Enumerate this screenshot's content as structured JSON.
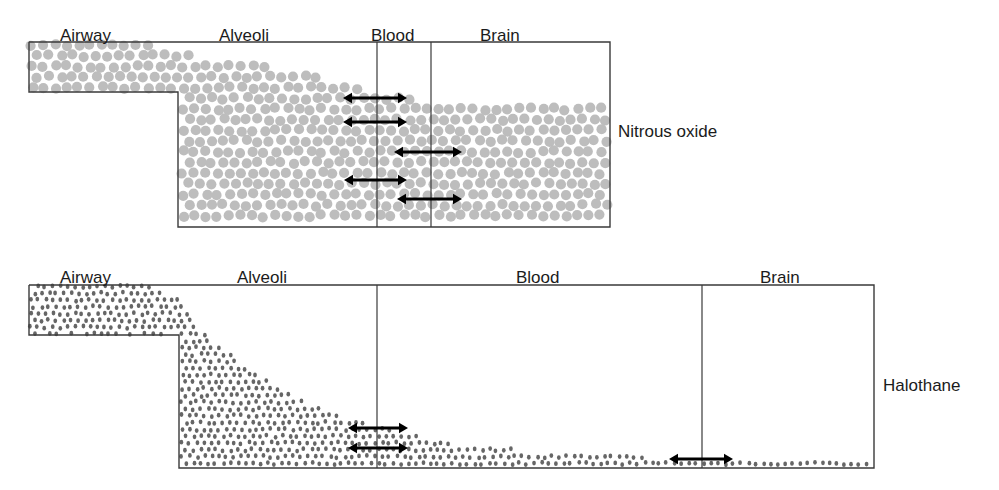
{
  "figure": {
    "type": "diagram",
    "background_color": "#ffffff",
    "line_color": "#3a3a3a",
    "text_color": "#1b1b1b"
  },
  "panels": [
    {
      "id": "nitrous-oxide",
      "agent_label": "Nitrous oxide",
      "agent_label_pos": {
        "x": 618,
        "y": 122
      },
      "dot": {
        "color": "#bdbdbd",
        "radius": 5.1,
        "spacing": 11.6,
        "jitter": 1.5,
        "shape": "circle"
      },
      "frame": {
        "left": 29,
        "top": 42,
        "right": 610,
        "bottom": 227,
        "step_x": 178,
        "step_y": 92
      },
      "dividers": [
        {
          "name": "alveoli-blood-divider",
          "x": 377
        },
        {
          "name": "blood-brain-divider",
          "x": 431
        }
      ],
      "columns": [
        {
          "label": "Airway",
          "x": 60,
          "y": 26
        },
        {
          "label": "Alveoli",
          "x": 219,
          "y": 26
        },
        {
          "label": "Blood",
          "x": 371,
          "y": 26
        },
        {
          "label": "Brain",
          "x": 480,
          "y": 26
        }
      ],
      "profile_note": "Gas fills airway to the top border; alveoli nearly full; blood and brain partially filled, concentration drops only slightly across compartments (low blood solubility).",
      "profile_points": [
        {
          "x": 29,
          "y": 42
        },
        {
          "x": 150,
          "y": 44
        },
        {
          "x": 200,
          "y": 56
        },
        {
          "x": 300,
          "y": 70
        },
        {
          "x": 360,
          "y": 86
        },
        {
          "x": 380,
          "y": 94
        },
        {
          "x": 420,
          "y": 100
        },
        {
          "x": 470,
          "y": 102
        },
        {
          "x": 540,
          "y": 103
        },
        {
          "x": 610,
          "y": 104
        }
      ],
      "arrows": [
        {
          "name": "gradient-arrow-1",
          "x1": 343,
          "x2": 407,
          "y": 98
        },
        {
          "name": "gradient-arrow-2",
          "x1": 343,
          "x2": 407,
          "y": 122
        },
        {
          "name": "gradient-arrow-3",
          "x1": 394,
          "x2": 462,
          "y": 152
        },
        {
          "name": "gradient-arrow-4",
          "x1": 344,
          "x2": 407,
          "y": 180
        },
        {
          "name": "gradient-arrow-5",
          "x1": 397,
          "x2": 462,
          "y": 199
        }
      ]
    },
    {
      "id": "halothane",
      "agent_label": "Halothane",
      "agent_label_pos": {
        "x": 883,
        "y": 376
      },
      "dot": {
        "color": "#666666",
        "radius": 2.4,
        "spacing": 7.4,
        "jitter": 1.3,
        "shape": "ellipse"
      },
      "frame": {
        "left": 29,
        "top": 285,
        "right": 874,
        "bottom": 468,
        "step_x": 179,
        "step_y": 335
      },
      "dividers": [
        {
          "name": "alveoli-blood-divider",
          "x": 377
        },
        {
          "name": "blood-brain-divider",
          "x": 702
        }
      ],
      "columns": [
        {
          "label": "Airway",
          "x": 60,
          "y": 268
        },
        {
          "label": "Alveoli",
          "x": 237,
          "y": 268
        },
        {
          "label": "Blood",
          "x": 516,
          "y": 268
        },
        {
          "label": "Brain",
          "x": 760,
          "y": 268
        }
      ],
      "profile_note": "Vapour fills airway to the top border, then concentration falls steeply through alveoli and blood, leaving only a thin layer reaching the brain (high blood solubility).",
      "profile_points": [
        {
          "x": 29,
          "y": 285
        },
        {
          "x": 150,
          "y": 286
        },
        {
          "x": 179,
          "y": 300
        },
        {
          "x": 200,
          "y": 330
        },
        {
          "x": 250,
          "y": 370
        },
        {
          "x": 300,
          "y": 400
        },
        {
          "x": 350,
          "y": 418
        },
        {
          "x": 400,
          "y": 432
        },
        {
          "x": 460,
          "y": 444
        },
        {
          "x": 540,
          "y": 452
        },
        {
          "x": 620,
          "y": 456
        },
        {
          "x": 702,
          "y": 458
        },
        {
          "x": 790,
          "y": 459
        },
        {
          "x": 874,
          "y": 460
        }
      ],
      "arrows": [
        {
          "name": "gradient-arrow-1",
          "x1": 348,
          "x2": 408,
          "y": 428
        },
        {
          "name": "gradient-arrow-2",
          "x1": 348,
          "x2": 408,
          "y": 448
        },
        {
          "name": "gradient-arrow-3",
          "x1": 669,
          "x2": 733,
          "y": 459
        }
      ]
    }
  ]
}
